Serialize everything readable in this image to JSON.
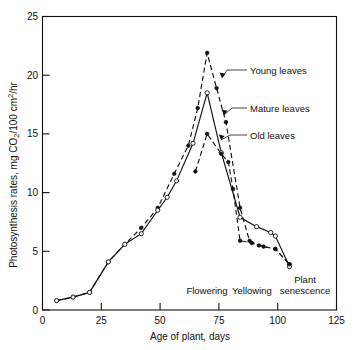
{
  "chart_data": {
    "type": "line",
    "title": "",
    "xlabel": "Age of plant, days",
    "ylabel": "Photosynthesis rates, mg CO2/100 cm2/hr",
    "ylabel_parts": {
      "prefix": "Photosynthesis rates,  mg CO",
      "sub1": "2",
      "middle": "/100 cm",
      "sup1": "2",
      "suffix": "/hr"
    },
    "xlim": [
      0,
      125
    ],
    "ylim": [
      0,
      25
    ],
    "xticks": [
      0,
      25,
      50,
      75,
      100,
      125
    ],
    "xticklabels": [
      "0",
      "25",
      "50",
      "75",
      "100",
      "125"
    ],
    "yticks": [
      0,
      5,
      10,
      15,
      20,
      25
    ],
    "yticklabels": [
      "0",
      "5",
      "10",
      "15",
      "20",
      "25"
    ],
    "grid": false,
    "legend_position": "inline-callouts",
    "series": [
      {
        "name": "Young leaves",
        "style": "dashed",
        "marker": "filled-circle",
        "label": "Young leaves",
        "points": [
          {
            "x": 6,
            "y": 0.8
          },
          {
            "x": 13,
            "y": 1.1
          },
          {
            "x": 20,
            "y": 1.5
          },
          {
            "x": 28,
            "y": 4.1
          },
          {
            "x": 35,
            "y": 5.6
          },
          {
            "x": 42,
            "y": 7.0
          },
          {
            "x": 49,
            "y": 8.7
          },
          {
            "x": 56,
            "y": 11.6
          },
          {
            "x": 62,
            "y": 14.0
          },
          {
            "x": 66,
            "y": 17.2
          },
          {
            "x": 70,
            "y": 21.9
          },
          {
            "x": 74,
            "y": 18.9
          },
          {
            "x": 78,
            "y": 16.0
          },
          {
            "x": 84,
            "y": 8.7
          },
          {
            "x": 88,
            "y": 5.9
          },
          {
            "x": 92,
            "y": 5.5
          },
          {
            "x": 99,
            "y": 5.2
          },
          {
            "x": 105,
            "y": 3.9
          }
        ]
      },
      {
        "name": "Mature leaves",
        "style": "solid",
        "marker": "open-circle",
        "label": "Mature leaves",
        "points": [
          {
            "x": 6,
            "y": 0.8
          },
          {
            "x": 13,
            "y": 1.1
          },
          {
            "x": 20,
            "y": 1.5
          },
          {
            "x": 28,
            "y": 4.1
          },
          {
            "x": 35,
            "y": 5.6
          },
          {
            "x": 42,
            "y": 6.5
          },
          {
            "x": 49,
            "y": 8.5
          },
          {
            "x": 53,
            "y": 9.6
          },
          {
            "x": 57,
            "y": 11.0
          },
          {
            "x": 64,
            "y": 14.2
          },
          {
            "x": 70,
            "y": 18.5
          },
          {
            "x": 76,
            "y": 13.4
          },
          {
            "x": 84,
            "y": 7.9
          },
          {
            "x": 91,
            "y": 7.1
          },
          {
            "x": 97,
            "y": 6.6
          },
          {
            "x": 99,
            "y": 6.3
          },
          {
            "x": 105,
            "y": 3.7
          }
        ]
      },
      {
        "name": "Old leaves",
        "style": "dashed",
        "marker": "filled-circle",
        "label": "Old leaves",
        "points": [
          {
            "x": 65,
            "y": 11.8
          },
          {
            "x": 70,
            "y": 15.0
          },
          {
            "x": 76,
            "y": 13.3
          },
          {
            "x": 79,
            "y": 12.6
          },
          {
            "x": 81,
            "y": 10.3
          },
          {
            "x": 84,
            "y": 5.9
          },
          {
            "x": 89,
            "y": 5.7
          },
          {
            "x": 94,
            "y": 5.4
          },
          {
            "x": 99,
            "y": 5.2
          },
          {
            "x": 105,
            "y": 3.9
          }
        ]
      }
    ],
    "annotations": [
      {
        "name": "flowering",
        "text": "Flowering",
        "x": 64,
        "y": 0.85
      },
      {
        "name": "yellowing",
        "text": "Yellowing",
        "x": 83,
        "y": 0.85
      },
      {
        "name": "plant-senescence-line1",
        "text": "Plant",
        "x": 103,
        "y": 1.85
      },
      {
        "name": "plant-senescence-line2",
        "text": "senescence",
        "x": 103,
        "y": 0.85
      }
    ]
  }
}
